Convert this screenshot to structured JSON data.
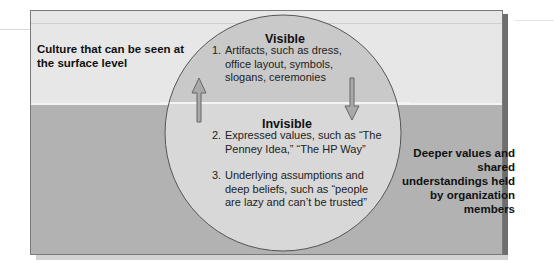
{
  "diagram": {
    "type": "iceberg-culture-levels",
    "left_label": "Culture that can be seen at the surface level",
    "right_label": "Deeper values and shared understandings held by organization members",
    "visible": {
      "heading": "Visible",
      "items": [
        {
          "num": "1.",
          "lines": [
            "Artifacts, such as dress,",
            "office layout, symbols,",
            "slogans, ceremonies"
          ]
        }
      ]
    },
    "invisible": {
      "heading": "Invisible",
      "items": [
        {
          "num": "2.",
          "lines": [
            "Expressed values, such as “The",
            "Penney Idea,” “The HP Way”"
          ]
        },
        {
          "num": "3.",
          "lines": [
            "Underlying assumptions and",
            "deep beliefs, such as “people",
            "are lazy and can’t be trusted”"
          ]
        }
      ]
    },
    "arrows": [
      {
        "name": "up-arrow-icon",
        "direction": "up"
      },
      {
        "name": "down-arrow-icon",
        "direction": "down"
      }
    ],
    "colors": {
      "surface_band": "#e7e7e7",
      "deep_band": "#b2b2b2",
      "circle_visible": "#c9c9c9",
      "circle_invisible": "#d9d9d9",
      "outline": "#555555",
      "text": "#111111"
    }
  }
}
